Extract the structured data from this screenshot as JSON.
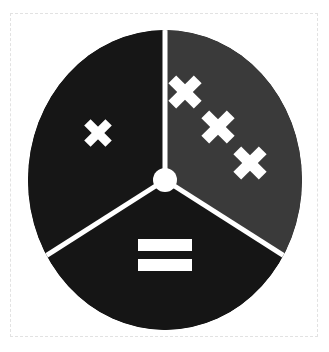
{
  "canvas": {
    "width": 329,
    "height": 352,
    "background_color": "#ffffff"
  },
  "frame": {
    "style": "dashed",
    "color": "#e2e2e2",
    "left": 10,
    "top": 13,
    "width": 308,
    "height": 324
  },
  "emblem": {
    "name": "three-spoke-roundel",
    "shape": "circle",
    "center_x": 137,
    "center_y": 150,
    "radius_x": 137,
    "radius_y": 150,
    "divider_color": "#ffffff",
    "divider_width": 5,
    "hub": {
      "name": "center-hub",
      "shape": "circle",
      "radius": 12,
      "fill": "#ffffff"
    },
    "segments": [
      {
        "id": "left",
        "label": "left-segment",
        "fill": "#161616",
        "start_angle_deg": 180,
        "end_angle_deg": 300,
        "symbol": {
          "type": "saltire-cross",
          "label": "single-cross",
          "count": 1,
          "color": "#ffffff"
        }
      },
      {
        "id": "right",
        "label": "right-segment",
        "fill": "#3a3a3a",
        "start_angle_deg": 300,
        "end_angle_deg": 60,
        "symbol": {
          "type": "saltire-cross",
          "label": "triple-cross-diagonal",
          "count": 3,
          "color": "#ffffff"
        }
      },
      {
        "id": "bottom",
        "label": "bottom-segment",
        "fill": "#151515",
        "start_angle_deg": 60,
        "end_angle_deg": 180,
        "symbol": {
          "type": "equals-sign",
          "label": "equals-bars",
          "count": 2,
          "color": "#ffffff"
        }
      }
    ]
  }
}
